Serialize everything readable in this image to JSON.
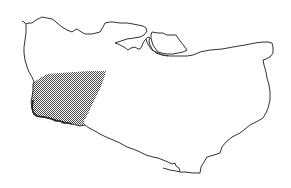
{
  "map": {
    "subject": "county-outline",
    "outline_color": "#333333",
    "hatch_color": "#555555",
    "background": "#ffffff",
    "regions": [
      {
        "name": "highlighted-region",
        "pattern": "crosshatch",
        "location": "west"
      }
    ],
    "features": [
      "mainland-outline",
      "island-outline",
      "estuary-inlet"
    ]
  }
}
